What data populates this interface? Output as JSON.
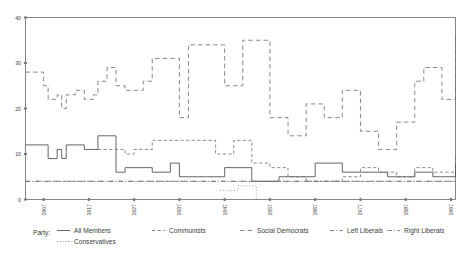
{
  "chart_data": {
    "type": "line",
    "subtype": "step-post",
    "title": "",
    "xlabel": "",
    "ylabel": "",
    "xlim": [
      1903,
      1998
    ],
    "ylim": [
      0,
      40
    ],
    "yticks": [
      0,
      10,
      20,
      30,
      40
    ],
    "xticks": [
      1907,
      1917,
      1927,
      1937,
      1947,
      1957,
      1967,
      1977,
      1987,
      1997
    ],
    "xtick_labels": [
      "1907",
      "1917",
      "1927",
      "1937",
      "1947",
      "1957",
      "1967",
      "1977",
      "1987",
      "1997"
    ],
    "ytick_labels": [
      "0",
      "10",
      "20",
      "30",
      "40"
    ],
    "grid": false,
    "legend_position": "below-axes",
    "legend_title": "Party:",
    "series": [
      {
        "name": "All Members",
        "style": "solid",
        "color": "#4a4a4a",
        "x": [
          1903,
          1907,
          1908,
          1910,
          1911,
          1912,
          1914,
          1916,
          1918,
          1919,
          1921,
          1923,
          1925,
          1927,
          1929,
          1931,
          1933,
          1935,
          1937,
          1939,
          1941,
          1943,
          1945,
          1947,
          1949,
          1951,
          1953,
          1955,
          1957,
          1959,
          1961,
          1963,
          1965,
          1967,
          1969,
          1971,
          1973,
          1975,
          1977,
          1979,
          1981,
          1983,
          1985,
          1987,
          1989,
          1991,
          1993,
          1995,
          1998
        ],
        "y": [
          12,
          12,
          9,
          11,
          9,
          12,
          12,
          11,
          11,
          14,
          14,
          6,
          7,
          7,
          7,
          6,
          6,
          8,
          5,
          5,
          5,
          5,
          5,
          7,
          7,
          7,
          4,
          4,
          4,
          5,
          5,
          5,
          5,
          8,
          8,
          8,
          6,
          6,
          6,
          6,
          6,
          5,
          5,
          5,
          6,
          6,
          5,
          5,
          8
        ]
      },
      {
        "name": "Communists",
        "style": "dashed",
        "color": "#6d6d6d",
        "x": [
          1919,
          1921,
          1923,
          1925,
          1927,
          1929,
          1931,
          1933,
          1935,
          1937,
          1939,
          1941,
          1943,
          1945,
          1947,
          1949,
          1951,
          1953,
          1955,
          1957,
          1959,
          1961,
          1963,
          1965,
          1967,
          1969,
          1971,
          1973,
          1975,
          1977,
          1979,
          1981,
          1983,
          1985,
          1987,
          1989,
          1991,
          1993,
          1995,
          1998
        ],
        "y": [
          11,
          11,
          11,
          10,
          11,
          11,
          13,
          13,
          13,
          13,
          13,
          13,
          13,
          10,
          10,
          13,
          13,
          8,
          8,
          7,
          7,
          5,
          5,
          4,
          4,
          4,
          4,
          5,
          5,
          7,
          7,
          6,
          6,
          5,
          5,
          7,
          7,
          6,
          6,
          10
        ]
      },
      {
        "name": "Social Democrats",
        "style": "dashed-long",
        "color": "#6d6d6d",
        "x": [
          1903,
          1905,
          1907,
          1908,
          1910,
          1911,
          1912,
          1914,
          1916,
          1918,
          1919,
          1921,
          1923,
          1925,
          1927,
          1929,
          1931,
          1933,
          1935,
          1937,
          1939,
          1941,
          1943,
          1945,
          1947,
          1949,
          1951,
          1953,
          1955,
          1957,
          1959,
          1961,
          1963,
          1965,
          1967,
          1969,
          1971,
          1973,
          1975,
          1977,
          1979,
          1981,
          1983,
          1985,
          1987,
          1989,
          1991,
          1993,
          1995,
          1998
        ],
        "y": [
          28,
          28,
          25,
          22,
          23,
          20,
          23,
          24,
          22,
          23,
          26,
          29,
          25,
          24,
          24,
          26,
          31,
          31,
          31,
          18,
          34,
          34,
          34,
          34,
          25,
          25,
          35,
          35,
          35,
          18,
          18,
          14,
          14,
          21,
          21,
          18,
          18,
          24,
          24,
          15,
          15,
          11,
          11,
          17,
          17,
          26,
          29,
          29,
          22,
          36
        ]
      },
      {
        "name": "Left Liberals",
        "style": "dash-dot",
        "color": "#6d6d6d",
        "x": [
          1903,
          1907,
          1910,
          1912,
          1916,
          1919,
          1921,
          1925,
          1929,
          1933,
          1937,
          1941,
          1945,
          1949,
          1953,
          1957,
          1961,
          1965,
          1969,
          1973,
          1977,
          1981,
          1985,
          1989,
          1993,
          1998
        ],
        "y": [
          4,
          4,
          4,
          4,
          4,
          4,
          4,
          4,
          4,
          4,
          4,
          4,
          4,
          4,
          4,
          4,
          4,
          4,
          4,
          4,
          4,
          4,
          4,
          4,
          4,
          4
        ]
      },
      {
        "name": "Right Liberals",
        "style": "dash-dot-2",
        "color": "#6d6d6d",
        "x": [
          1903,
          1907,
          1910,
          1914,
          1918,
          1922,
          1926,
          1930,
          1934,
          1938,
          1942,
          1946,
          1950,
          1954,
          1958,
          1962,
          1966,
          1970,
          1974,
          1978,
          1982,
          1986,
          1990,
          1994,
          1998
        ],
        "y": [
          4,
          4,
          4,
          4,
          4,
          4,
          4,
          4,
          4,
          4,
          4,
          4,
          4,
          4,
          4,
          4,
          4,
          4,
          4,
          4,
          4,
          4,
          4,
          4,
          4
        ]
      },
      {
        "name": "Conservatives",
        "style": "dotted",
        "color": "#8a8a8a",
        "x": [
          1946,
          1948,
          1950,
          1952,
          1954
        ],
        "y": [
          2,
          2,
          3,
          3,
          0
        ]
      }
    ]
  },
  "legend": {
    "title": "Party:",
    "items": [
      {
        "label": "All Members",
        "style": "solid"
      },
      {
        "label": "Communists",
        "style": "dashed"
      },
      {
        "label": "Social Democrats",
        "style": "dashed-long"
      },
      {
        "label": "Left Liberals",
        "style": "dash-dot"
      },
      {
        "label": "Right Liberals",
        "style": "dash-dot-2"
      },
      {
        "label": "Conservatives",
        "style": "dotted"
      }
    ]
  },
  "colors": {
    "axis": "#77797c",
    "text": "#3d3d3d",
    "solid_series": "#4a4a4a",
    "dashed_series": "#6d6d6d",
    "background": "#ffffff"
  }
}
